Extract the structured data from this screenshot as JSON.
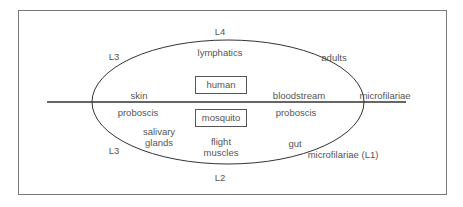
{
  "diagram": {
    "title": "",
    "boxes": {
      "human": "human",
      "mosquito": "mosquito"
    },
    "stages": {
      "top": "L4",
      "top_left": "L3",
      "bottom_left": "L3",
      "bottom": "L2"
    },
    "human_side": {
      "lymphatics": "lymphatics",
      "adults": "adults",
      "skin": "skin",
      "bloodstream": "bloodstream",
      "microfilariae": "microfilariae"
    },
    "mosquito_side": {
      "proboscis_left": "proboscis",
      "proboscis_right": "proboscis",
      "salivary_glands_line1": "salivary",
      "salivary_glands_line2": "glands",
      "flight_muscles_line1": "flight",
      "flight_muscles_line2": "muscles",
      "gut": "gut",
      "microfilariae_l1": "microfilariae (L1)"
    },
    "colors": {
      "line": "#333333",
      "text": "#555555",
      "frame": "#7a7a7a"
    }
  }
}
